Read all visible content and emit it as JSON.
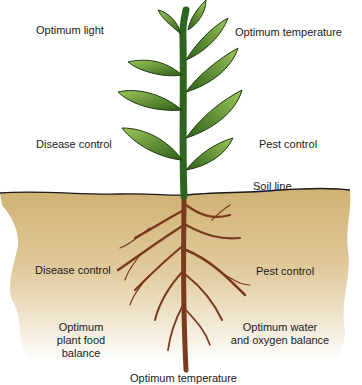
{
  "labels": {
    "optimum_light": "Optimum light",
    "optimum_temperature_top": "Optimum temperature",
    "disease_control_top": "Disease control",
    "pest_control_top": "Pest control",
    "soil_line": "Soil line",
    "disease_control_bottom": "Disease control",
    "pest_control_bottom": "Pest control",
    "plant_food_line1": "Optimum",
    "plant_food_line2": "plant food",
    "plant_food_line3": "balance",
    "water_line1": "Optimum water",
    "water_line2": "and oxygen balance",
    "optimum_temperature_bottom": "Optimum temperature"
  },
  "colors": {
    "soil_top": "#d2b478",
    "soil_bottom": "#ffffff",
    "soil_line": "#1a1a1a",
    "leaf_dark": "#3f6e1c",
    "leaf_light": "#9cc75a",
    "stem": "#2f6420",
    "root": "#7a3a1e"
  }
}
